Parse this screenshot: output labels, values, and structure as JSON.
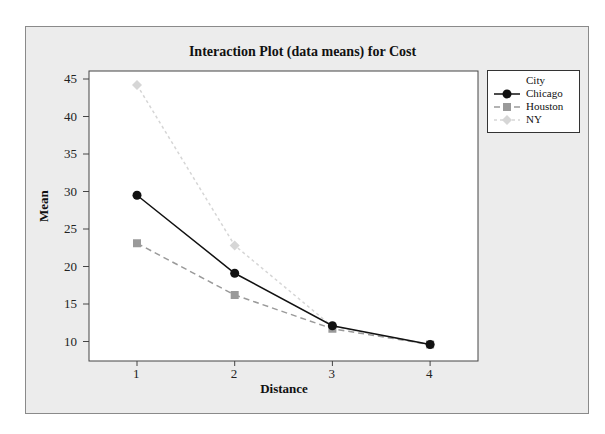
{
  "chart_data": {
    "type": "line",
    "title": "Interaction Plot (data means) for Cost",
    "xlabel": "Distance",
    "ylabel": "Mean",
    "x": [
      1,
      2,
      3,
      4
    ],
    "x_tick_labels": [
      "1",
      "2",
      "3",
      "4"
    ],
    "y_tick_labels": [
      "10",
      "15",
      "20",
      "25",
      "30",
      "35",
      "40",
      "45"
    ],
    "ylim": [
      7.3,
      46
    ],
    "grid": false,
    "legend_title": "City",
    "legend_position": "right",
    "series": [
      {
        "name": "Chicago",
        "values": [
          29.5,
          19.1,
          12.1,
          9.6
        ],
        "color": "#111111",
        "marker": "circle",
        "line": "solid"
      },
      {
        "name": "Houston",
        "values": [
          23.1,
          16.2,
          11.7,
          9.6
        ],
        "color": "#9a9a9a",
        "marker": "square",
        "line": "dashed"
      },
      {
        "name": "NY",
        "values": [
          44.2,
          22.8,
          12.0,
          9.6
        ],
        "color": "#d6d6d6",
        "marker": "diamond",
        "line": "dotted"
      }
    ]
  }
}
